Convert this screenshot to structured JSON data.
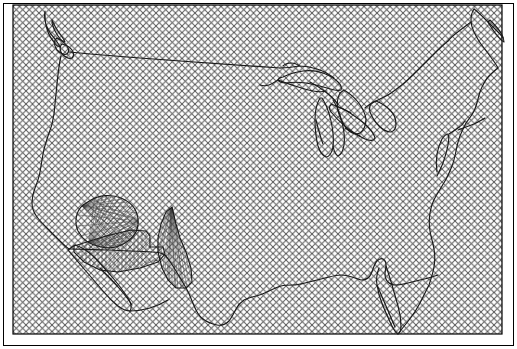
{
  "figure": {
    "type": "map",
    "width": 517,
    "height": 349,
    "background_color": "#ffffff"
  },
  "outer_frame": {
    "name": "outer-border",
    "x": 3,
    "y": 3,
    "width": 511,
    "height": 343,
    "stroke_color": "#000000",
    "stroke_width": 1,
    "fill": "none"
  },
  "hatched_region": {
    "name": "crosshatch-extent-rectangle",
    "x": 13,
    "y": 5,
    "width": 489,
    "height": 329,
    "stroke_color": "#000000",
    "stroke_width": 1.2,
    "pattern": {
      "type": "crosshatch-diagonal",
      "spacing_px": 6.5,
      "angle_deg": 45,
      "line_color": "#555555",
      "line_width": 0.9
    }
  },
  "coastline": {
    "name": "usa-coastline",
    "stroke_color": "#1a1a1a",
    "stroke_width": 1.15,
    "fill": "none",
    "path": "M 44 13 L 46 20 L 49 27 L 52 33 L 55 38 L 58 41 L 61 43 L 63 46 L 62 51 L 60 53 L 58 51 L 55 47 L 52 44 L 50 47 L 52 52 L 56 56 L 60 59 L 64 61 L 68 62 L 71 60 L 73 56 L 72 51 L 70 46 L 68 41 L 65 35 L 62 29 L 58 22 L 54 16 L 50 12 Z"
  },
  "border_49th": {
    "name": "canada-us-border-49th-parallel",
    "stroke_color": "#1a1a1a",
    "stroke_width": 1.0,
    "description": "Straight boundary line running east from Puget Sound across the northern plains toward the Great Lakes"
  },
  "fan_polygons": [
    {
      "name": "fan-polygon-southwest-blob",
      "description": "Rounded blob region in the southwest with radial fan line fill",
      "centroid_x": 107,
      "centroid_y": 226,
      "stroke_color": "#1a1a1a",
      "fill_line_color": "#444444",
      "fill_line_width": 0.45,
      "fan_rays": 46
    },
    {
      "name": "fan-polygon-southwest-spike",
      "description": "Narrow spike region with near-vertical fan line fill",
      "centroid_x": 172,
      "centroid_y": 252,
      "stroke_color": "#1a1a1a",
      "fill_line_color": "#444444",
      "fill_line_width": 0.45,
      "fan_rays": 40
    },
    {
      "name": "fan-polygon-southwest-band",
      "description": "Elongated band between the blob and the spike, vertically hatched",
      "centroid_x": 140,
      "centroid_y": 250,
      "stroke_color": "#1a1a1a",
      "fill_line_color": "#444444",
      "fill_line_width": 0.45,
      "fan_rays": 38
    }
  ],
  "features": [
    {
      "name": "feature-puget-sound",
      "label": "Puget Sound",
      "x": 48,
      "y": 30
    },
    {
      "name": "feature-great-lakes",
      "label": "Great Lakes",
      "x": 330,
      "y": 95
    },
    {
      "name": "feature-lake-superior",
      "label": "Lake Superior",
      "x": 305,
      "y": 75
    },
    {
      "name": "feature-lake-michigan",
      "label": "Lake Michigan",
      "x": 330,
      "y": 120
    },
    {
      "name": "feature-maine",
      "label": "Maine",
      "x": 470,
      "y": 35
    },
    {
      "name": "feature-florida",
      "label": "Florida",
      "x": 395,
      "y": 300
    },
    {
      "name": "feature-texas-gulf-coast",
      "label": "Gulf Coast",
      "x": 265,
      "y": 300
    },
    {
      "name": "feature-california-coast",
      "label": "Pacific Coast",
      "x": 35,
      "y": 210
    },
    {
      "name": "feature-baja-california",
      "label": "Baja California",
      "x": 75,
      "y": 290
    }
  ],
  "colors": {
    "ink": "#1a1a1a",
    "hatch": "#555555",
    "fan": "#444444",
    "paper": "#ffffff"
  }
}
